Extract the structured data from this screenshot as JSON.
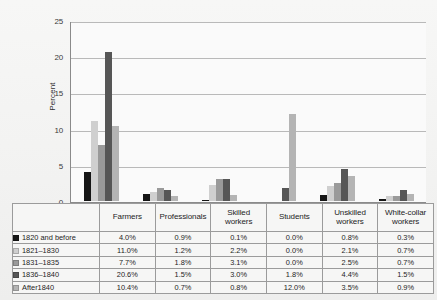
{
  "chart_data": {
    "type": "bar",
    "title": "",
    "xlabel": "",
    "ylabel": "Percent",
    "ylim": [
      0,
      25
    ],
    "yticks": [
      "0",
      "5",
      "10",
      "15",
      "20",
      "25"
    ],
    "grid": true,
    "legend_position": "table-below",
    "categories": [
      "Farmers",
      "Professionals",
      "Skilled workers",
      "Students",
      "Unskilled workers",
      "White-collar workers"
    ],
    "category_lines": [
      [
        "Farmers"
      ],
      [
        "Professionals"
      ],
      [
        "Skilled",
        "workers"
      ],
      [
        "Students"
      ],
      [
        "Unskilled",
        "workers"
      ],
      [
        "White-collar",
        "workers"
      ]
    ],
    "series": [
      {
        "name": "1820 and before",
        "color": "#151515",
        "values": [
          4.0,
          0.9,
          0.1,
          0.0,
          0.8,
          0.3
        ],
        "labels": [
          "4.0%",
          "0.9%",
          "0.1%",
          "0.0%",
          "0.8%",
          "0.3%"
        ]
      },
      {
        "name": "1821–1830",
        "color": "#cfcfcf",
        "values": [
          11.0,
          1.2,
          2.2,
          0.0,
          2.1,
          0.7
        ],
        "labels": [
          "11.0%",
          "1.2%",
          "2.2%",
          "0.0%",
          "2.1%",
          "0.7%"
        ]
      },
      {
        "name": "1831–1835",
        "color": "#9a9a9a",
        "values": [
          7.7,
          1.8,
          3.1,
          0.0,
          2.5,
          0.7
        ],
        "labels": [
          "7.7%",
          "1.8%",
          "3.1%",
          "0.0%",
          "2.5%",
          "0.7%"
        ]
      },
      {
        "name": "1836–1840",
        "color": "#565656",
        "values": [
          20.6,
          1.5,
          3.0,
          1.8,
          4.4,
          1.5
        ],
        "labels": [
          "20.6%",
          "1.5%",
          "3.0%",
          "1.8%",
          "4.4%",
          "1.5%"
        ]
      },
      {
        "name": "After1840",
        "color": "#b4b4b4",
        "values": [
          10.4,
          0.7,
          0.8,
          12.0,
          3.5,
          0.9
        ],
        "labels": [
          "10.4%",
          "0.7%",
          "0.8%",
          "12.0%",
          "3.5%",
          "0.9%"
        ]
      }
    ]
  }
}
